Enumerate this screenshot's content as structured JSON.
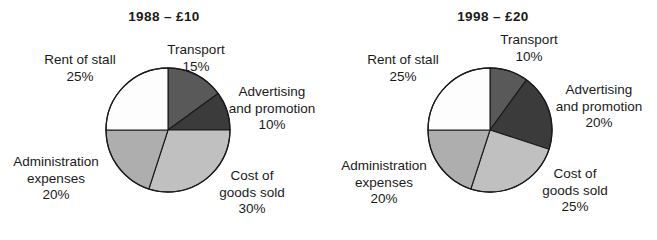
{
  "figure": {
    "background": "#ffffff",
    "outline_color": "#1a1a1a"
  },
  "chart_data": [
    {
      "type": "pie",
      "title": "1988 – £10",
      "id": "1988",
      "start_angle_deg": 0,
      "direction": "clockwise",
      "center": {
        "x": 168,
        "y": 130
      },
      "radius": 62,
      "categories": [
        "Transport",
        "Advertising and promotion",
        "Cost of goods sold",
        "Administration expenses",
        "Rent of stall"
      ],
      "values": [
        15,
        10,
        30,
        20,
        25
      ],
      "value_labels": [
        "15%",
        "10%",
        "30%",
        "20%",
        "25%"
      ],
      "colors": [
        "#595959",
        "#3b3b3b",
        "#c0c0c0",
        "#aeaeae",
        "#fdfdfd"
      ],
      "slices": [
        {
          "name": "Transport",
          "label_line1": "Transport",
          "pct": "15%",
          "value": 15,
          "color": "#595959"
        },
        {
          "name": "Advertising and promotion",
          "label_line1": "Advertising",
          "label_line2": "and promotion",
          "pct": "10%",
          "value": 10,
          "color": "#3b3b3b"
        },
        {
          "name": "Cost of goods sold",
          "label_line1": "Cost of",
          "label_line2": "goods sold",
          "pct": "30%",
          "value": 30,
          "color": "#c0c0c0"
        },
        {
          "name": "Administration expenses",
          "label_line1": "Administration",
          "label_line2": "expenses",
          "pct": "20%",
          "value": 20,
          "color": "#aeaeae"
        },
        {
          "name": "Rent of stall",
          "label_line1": "Rent of stall",
          "pct": "25%",
          "value": 25,
          "color": "#fdfdfd"
        }
      ]
    },
    {
      "type": "pie",
      "title": "1998 – £20",
      "id": "1998",
      "start_angle_deg": 0,
      "direction": "clockwise",
      "center": {
        "x": 161,
        "y": 130
      },
      "radius": 62,
      "categories": [
        "Transport",
        "Advertising and promotion",
        "Cost of goods sold",
        "Administration expenses",
        "Rent of stall"
      ],
      "values": [
        10,
        20,
        25,
        20,
        25
      ],
      "value_labels": [
        "10%",
        "20%",
        "25%",
        "20%",
        "25%"
      ],
      "colors": [
        "#595959",
        "#3b3b3b",
        "#c0c0c0",
        "#aeaeae",
        "#fdfdfd"
      ],
      "slices": [
        {
          "name": "Transport",
          "label_line1": "Transport",
          "pct": "10%",
          "value": 10,
          "color": "#595959"
        },
        {
          "name": "Advertising and promotion",
          "label_line1": "Advertising",
          "label_line2": "and promotion",
          "pct": "20%",
          "value": 20,
          "color": "#3b3b3b"
        },
        {
          "name": "Cost of goods sold",
          "label_line1": "Cost of",
          "label_line2": "goods sold",
          "pct": "25%",
          "value": 25,
          "color": "#c0c0c0"
        },
        {
          "name": "Administration expenses",
          "label_line1": "Administration",
          "label_line2": "expenses",
          "pct": "20%",
          "value": 20,
          "color": "#aeaeae"
        },
        {
          "name": "Rent of stall",
          "label_line1": "Rent of stall",
          "pct": "25%",
          "value": 25,
          "color": "#fdfdfd"
        }
      ]
    }
  ]
}
